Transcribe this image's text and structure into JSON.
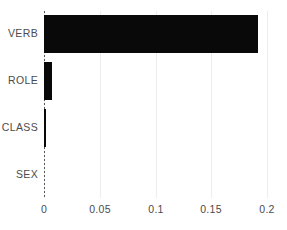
{
  "chart_data": {
    "type": "bar",
    "orientation": "horizontal",
    "title": "",
    "xlabel": "",
    "ylabel": "",
    "categories": [
      "VERB",
      "ROLE",
      "CLASS",
      "SEX"
    ],
    "values": [
      0.192,
      0.0072,
      0.0016,
      0.0
    ],
    "xlim": [
      0,
      0.2
    ],
    "xticks": [
      0,
      0.05,
      0.1,
      0.15,
      0.2
    ],
    "xtick_labels": [
      "0",
      "0.05",
      "0.1",
      "0.15",
      "0.2"
    ],
    "grid": true,
    "grid_axis": "x",
    "legend": null,
    "bar_color": "#090909",
    "gridline_color": "#eceded",
    "zero_line_color": "#58595b",
    "zero_line_style": "dotted",
    "label_color": "#4b4b4d",
    "background": "#ffffff"
  },
  "axes": {
    "y_labels": [
      {
        "text": "VERB"
      },
      {
        "text": "ROLE"
      },
      {
        "text": "CLASS"
      },
      {
        "text": "SEX"
      }
    ],
    "x_labels": [
      {
        "text": "0"
      },
      {
        "text": "0.05"
      },
      {
        "text": "0.1"
      },
      {
        "text": "0.15"
      },
      {
        "text": "0.2"
      }
    ]
  }
}
